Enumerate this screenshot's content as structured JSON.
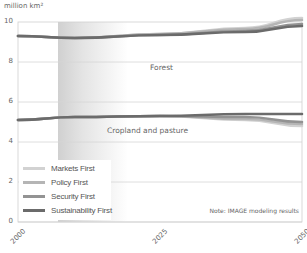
{
  "chart_data": {
    "type": "line",
    "title": "",
    "ylabel": "million km²",
    "xlabel": "",
    "ylim": [
      0,
      10
    ],
    "xlim": [
      2000,
      2050
    ],
    "yticks": [
      "0",
      "2",
      "4",
      "6",
      "8",
      "10"
    ],
    "xticks": [
      "2000",
      "2025",
      "2050"
    ],
    "grid": true,
    "legend_position": "lower-left",
    "annotations": [
      "Forest",
      "Cropland and pasture",
      "Note: IMAGE modeling results"
    ],
    "x": [
      2000,
      2010,
      2025,
      2040,
      2050
    ],
    "series": [
      {
        "name": "Markets First",
        "group": "Forest",
        "color": "#d2d2d2",
        "values": [
          9.3,
          9.2,
          9.4,
          9.7,
          10.2
        ]
      },
      {
        "name": "Policy First",
        "group": "Forest",
        "color": "#b5b5b5",
        "values": [
          9.3,
          9.2,
          9.4,
          9.65,
          10.1
        ]
      },
      {
        "name": "Security First",
        "group": "Forest",
        "color": "#939393",
        "values": [
          9.3,
          9.2,
          9.35,
          9.55,
          9.9
        ]
      },
      {
        "name": "Sustainability First",
        "group": "Forest",
        "color": "#6b6b6b",
        "values": [
          9.3,
          9.2,
          9.35,
          9.5,
          9.8
        ]
      },
      {
        "name": "Markets First",
        "group": "Cropland and pasture",
        "color": "#d2d2d2",
        "values": [
          5.1,
          5.25,
          5.3,
          5.1,
          4.8
        ]
      },
      {
        "name": "Policy First",
        "group": "Cropland and pasture",
        "color": "#b5b5b5",
        "values": [
          5.1,
          5.25,
          5.3,
          5.15,
          4.9
        ]
      },
      {
        "name": "Security First",
        "group": "Cropland and pasture",
        "color": "#939393",
        "values": [
          5.1,
          5.25,
          5.3,
          5.25,
          5.0
        ]
      },
      {
        "name": "Sustainability First",
        "group": "Cropland and pasture",
        "color": "#6b6b6b",
        "values": [
          5.1,
          5.25,
          5.3,
          5.4,
          5.4
        ]
      }
    ],
    "shaded_region": {
      "from": 2007,
      "to": 2020,
      "fade": true
    }
  },
  "labels": {
    "unit": "million km²",
    "forest": "Forest",
    "cropland": "Cropland and pasture",
    "note": "Note: IMAGE modeling results"
  },
  "legend": [
    {
      "label": "Markets First",
      "color": "#d2d2d2"
    },
    {
      "label": "Policy First",
      "color": "#b5b5b5"
    },
    {
      "label": "Security First",
      "color": "#939393"
    },
    {
      "label": "Sustainability First",
      "color": "#6b6b6b"
    }
  ],
  "yticks": [
    "10",
    "8",
    "6",
    "4",
    "2",
    "0"
  ],
  "xticks": [
    "2000",
    "2025",
    "2050"
  ]
}
